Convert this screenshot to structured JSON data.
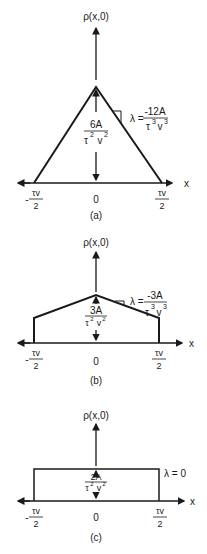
{
  "figure": {
    "panels": [
      {
        "id": "a",
        "caption": "(a)",
        "y_axis_label": "ρ(x,0)",
        "x_axis_label": "x",
        "ticks": {
          "left": "τv",
          "left_sign": "-",
          "left_den": "2",
          "center": "0",
          "right": "τv",
          "right_den": "2"
        },
        "peak_label": {
          "num": "6A",
          "den_base1": "τ",
          "den_exp1": "2",
          "den_base2": "v",
          "den_exp2": "2"
        },
        "slope_label": {
          "prefix": "λ =",
          "num": "-12A",
          "den_base1": "τ",
          "den_exp1": "3",
          "den_base2": "v",
          "den_exp2": "3"
        },
        "shape": "triangle"
      },
      {
        "id": "b",
        "caption": "(b)",
        "y_axis_label": "ρ(x,0)",
        "x_axis_label": "x",
        "ticks": {
          "left": "τv",
          "left_sign": "-",
          "left_den": "2",
          "center": "0",
          "right": "τv",
          "right_den": "2"
        },
        "peak_label": {
          "num": "3A",
          "den_base1": "τ",
          "den_exp1": "2",
          "den_base2": "v",
          "den_exp2": "2"
        },
        "slope_label": {
          "prefix": "λ =",
          "num": "-3A",
          "den_base1": "τ",
          "den_exp1": "3",
          "den_base2": "v",
          "den_exp2": "3"
        },
        "shape": "truncated-triangle"
      },
      {
        "id": "c",
        "caption": "(c)",
        "y_axis_label": "ρ(x,0)",
        "x_axis_label": "x",
        "ticks": {
          "left": "τv",
          "left_sign": "-",
          "left_den": "2",
          "center": "0",
          "right": "τv",
          "right_den": "2"
        },
        "peak_label": {
          "num": "2A",
          "den_base1": "τ",
          "den_exp1": "2",
          "den_base2": "v",
          "den_exp2": "2"
        },
        "slope_label": {
          "prefix": "λ = 0"
        },
        "shape": "rectangle"
      }
    ]
  }
}
